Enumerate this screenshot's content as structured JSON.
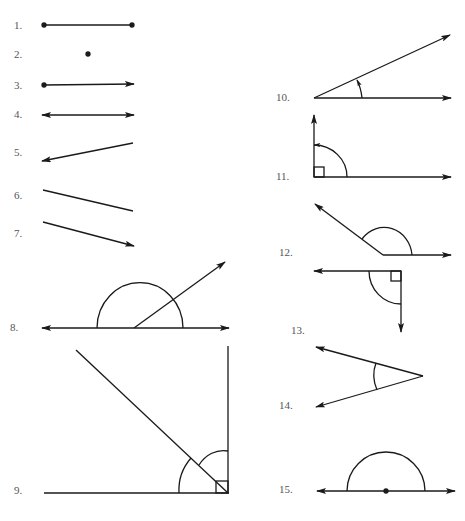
{
  "items": [
    {
      "n": "1.",
      "kind": "segment"
    },
    {
      "n": "2.",
      "kind": "point"
    },
    {
      "n": "3.",
      "kind": "ray"
    },
    {
      "n": "4.",
      "kind": "line"
    },
    {
      "n": "5.",
      "kind": "ray"
    },
    {
      "n": "6.",
      "kind": "segment"
    },
    {
      "n": "7.",
      "kind": "ray"
    },
    {
      "n": "8.",
      "kind": "angle-pair-on-line"
    },
    {
      "n": "9.",
      "kind": "right-angle-bisected"
    },
    {
      "n": "10.",
      "kind": "acute-angle"
    },
    {
      "n": "11.",
      "kind": "right-angle"
    },
    {
      "n": "12.",
      "kind": "obtuse-angle"
    },
    {
      "n": "13.",
      "kind": "right-angle"
    },
    {
      "n": "14.",
      "kind": "acute-angle"
    },
    {
      "n": "15.",
      "kind": "straight-angle"
    }
  ],
  "colors": {
    "stroke": "#1a1a1a",
    "label": "#555555"
  }
}
